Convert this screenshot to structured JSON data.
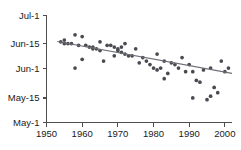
{
  "chart_data": {
    "type": "scatter",
    "title": "",
    "subtitle": "",
    "xlabel": "",
    "ylabel": "",
    "xlim": [
      1950,
      2002
    ],
    "ylim": [
      0,
      61
    ],
    "grid": false,
    "legend": "none",
    "x_tick_labels": [
      "1950",
      "1960",
      "1970",
      "1980",
      "1990",
      "2000"
    ],
    "x_tick_values": [
      1950,
      1960,
      1970,
      1980,
      1990,
      2000
    ],
    "y_tick_labels": [
      "May-1",
      "May-15",
      "Jun-1",
      "Jun-15",
      "Jul-1"
    ],
    "y_tick_values": [
      0,
      14,
      31,
      45,
      61
    ],
    "y_axis_note": "day-of-year offset from May-1 (May-1 = 0)",
    "series": [
      {
        "name": "observations",
        "marker": "circle",
        "color": "#4a4a52",
        "x": [
          1954,
          1955,
          1955,
          1956,
          1957,
          1958,
          1958,
          1959,
          1960,
          1960,
          1961,
          1962,
          1963,
          1963,
          1964,
          1965,
          1965,
          1966,
          1967,
          1968,
          1969,
          1969,
          1970,
          1970,
          1971,
          1971,
          1972,
          1972,
          1973,
          1974,
          1975,
          1976,
          1977,
          1978,
          1979,
          1980,
          1981,
          1981,
          1982,
          1983,
          1983,
          1984,
          1985,
          1986,
          1987,
          1988,
          1989,
          1990,
          1991,
          1991,
          1992,
          1993,
          1994,
          1995,
          1996,
          1996,
          1997,
          1998,
          1999,
          2000,
          2001
        ],
        "y": [
          46,
          47,
          45,
          45,
          45,
          50,
          31,
          44,
          49,
          36,
          44,
          43,
          43,
          42,
          42,
          46,
          41,
          35,
          44,
          44,
          43,
          38,
          42,
          41,
          43,
          40,
          45,
          39,
          38,
          38,
          42,
          34,
          37,
          35,
          33,
          31,
          30,
          39,
          31,
          25,
          35,
          28,
          34,
          33,
          31,
          37,
          29,
          33,
          29,
          14,
          24,
          23,
          30,
          13,
          15,
          31,
          20,
          17,
          35,
          29,
          31
        ]
      }
    ],
    "trend": {
      "name": "linear-fit",
      "color": "#6e6e76",
      "x_start": 1953,
      "y_start": 46.2,
      "x_end": 2002,
      "y_end": 28.0
    }
  }
}
